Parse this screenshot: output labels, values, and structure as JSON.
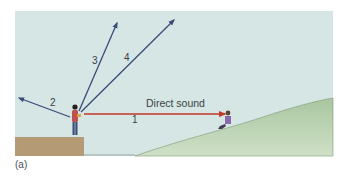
{
  "figure": {
    "caption": "(a)",
    "labels": {
      "direct_sound": "Direct sound",
      "ray1": "1",
      "ray2": "2",
      "ray3": "3",
      "ray4": "4"
    },
    "colors": {
      "sky": "#d5e6e5",
      "hill": "#b4cfaa",
      "cliff": "#b59a76",
      "direct_arrow": "#c0392b",
      "other_arrows": "#3c4b78"
    }
  }
}
